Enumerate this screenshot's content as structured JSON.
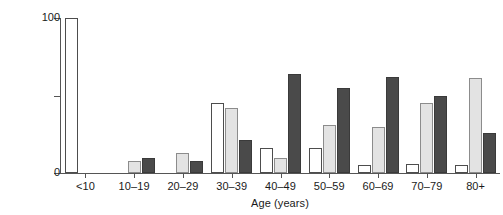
{
  "chart_data": {
    "type": "bar",
    "title": "",
    "subtitle": "",
    "xlabel": "Age (years)",
    "ylabel": "Patients (%)",
    "categories": [
      "<10",
      "10–19",
      "20–29",
      "30–39",
      "40–49",
      "50–59",
      "60–69",
      "70–79",
      "80+"
    ],
    "series": [
      {
        "name": "series-white",
        "color": "#ffffff",
        "values": [
          100,
          0,
          0,
          45,
          16,
          16,
          5,
          6,
          5
        ]
      },
      {
        "name": "series-light-gray",
        "color": "#e3e3e3",
        "values": [
          0,
          8,
          13,
          42,
          10,
          31,
          30,
          45,
          61
        ]
      },
      {
        "name": "series-dark-gray",
        "color": "#4a4a4a",
        "values": [
          0,
          10,
          8,
          21,
          64,
          55,
          62,
          50,
          26
        ]
      }
    ],
    "ylim": [
      0,
      100
    ],
    "yticks": [
      0,
      50,
      100
    ],
    "ytick_labels": [
      "0",
      "",
      "100"
    ],
    "grid": false,
    "legend": "none"
  },
  "axis": {
    "y_label": "Patients (%)",
    "x_label": "Age (years)"
  }
}
